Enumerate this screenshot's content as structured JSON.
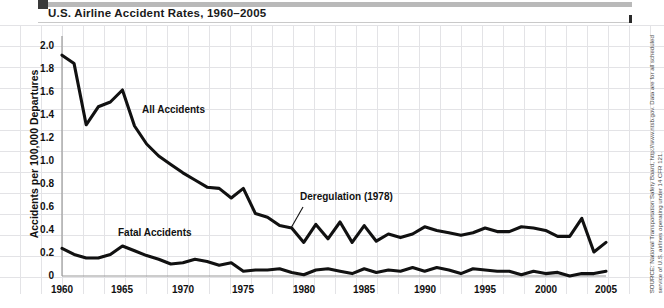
{
  "header": {
    "title": "U.S. Airline Accident Rates, 1960–2005"
  },
  "source": {
    "text": "SOURCE: National Transportation Safety Board, http://www.ntsb.gov. Data are for all scheduled service of U.S. airlines operating under 14 CFR 121."
  },
  "colors": {
    "line": "#111111",
    "grid": "#e3e3e6",
    "axis": "#9a9a9a",
    "title_bar": "#b9b9b9",
    "text": "#111111"
  },
  "chart_data": {
    "type": "line",
    "title": "U.S. Airline Accident Rates, 1960–2005",
    "xlabel": "",
    "ylabel": "Accidents per 100,000 Departures",
    "xlim": [
      1960,
      2005
    ],
    "ylim": [
      0,
      2.0
    ],
    "grid": true,
    "legend": "inline-labels",
    "xticks": [
      "1960",
      "1965",
      "1970",
      "1975",
      "1980",
      "1985",
      "1990",
      "1995",
      "2000",
      "2005"
    ],
    "yticks": [
      "0",
      "0.2",
      "0.4",
      "0.6",
      "0.8",
      "1.0",
      "1.2",
      "1.4",
      "1.6",
      "1.8",
      "2.0"
    ],
    "x": [
      1960,
      1961,
      1962,
      1963,
      1964,
      1965,
      1966,
      1967,
      1968,
      1969,
      1970,
      1971,
      1972,
      1973,
      1974,
      1975,
      1976,
      1977,
      1978,
      1979,
      1980,
      1981,
      1982,
      1983,
      1984,
      1985,
      1986,
      1987,
      1988,
      1989,
      1990,
      1991,
      1992,
      1993,
      1994,
      1995,
      1996,
      1997,
      1998,
      1999,
      2000,
      2001,
      2002,
      2003,
      2004,
      2005
    ],
    "series": [
      {
        "name": "All Accidents",
        "values": [
          1.84,
          1.77,
          1.26,
          1.41,
          1.45,
          1.55,
          1.25,
          1.1,
          1.0,
          0.93,
          0.86,
          0.8,
          0.74,
          0.73,
          0.65,
          0.73,
          0.52,
          0.49,
          0.42,
          0.4,
          0.28,
          0.43,
          0.31,
          0.45,
          0.28,
          0.42,
          0.29,
          0.35,
          0.32,
          0.35,
          0.41,
          0.38,
          0.36,
          0.34,
          0.36,
          0.4,
          0.37,
          0.37,
          0.41,
          0.4,
          0.38,
          0.33,
          0.33,
          0.48,
          0.2,
          0.28
        ]
      },
      {
        "name": "Fatal Accidents",
        "values": [
          0.23,
          0.18,
          0.15,
          0.15,
          0.18,
          0.25,
          0.21,
          0.17,
          0.14,
          0.1,
          0.11,
          0.14,
          0.12,
          0.09,
          0.11,
          0.04,
          0.05,
          0.05,
          0.06,
          0.03,
          0.01,
          0.05,
          0.06,
          0.04,
          0.02,
          0.06,
          0.03,
          0.05,
          0.04,
          0.07,
          0.04,
          0.07,
          0.05,
          0.02,
          0.06,
          0.05,
          0.04,
          0.04,
          0.01,
          0.04,
          0.02,
          0.03,
          0.0,
          0.02,
          0.02,
          0.04
        ]
      }
    ],
    "annotations": [
      {
        "label": "All Accidents",
        "x": 1966,
        "y": 1.28
      },
      {
        "label": "Fatal Accidents",
        "x": 1965,
        "y": 0.38
      },
      {
        "label": "Deregulation (1978)",
        "x": 1981,
        "y": 0.63,
        "leader_to": {
          "x": 1979,
          "y": 0.4
        }
      }
    ]
  }
}
